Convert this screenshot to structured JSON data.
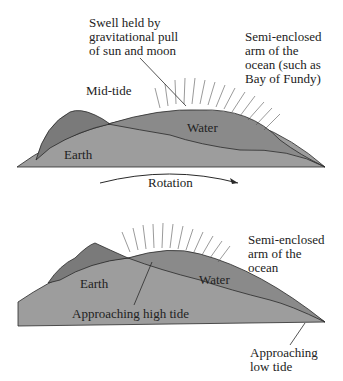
{
  "colors": {
    "earth": "#9d9d9d",
    "water": "#8a8a8a",
    "rock": "#7a7a7a",
    "line": "#2a2a2a"
  },
  "top_panel": {
    "swell_label": "Swell held by\ngravitational pull\nof sun and moon",
    "arm_label": "Semi-enclosed\narm of the\nocean (such as\nBay of Fundy)",
    "state_label": "Mid-tide",
    "water_label": "Water",
    "earth_label": "Earth",
    "rotation_label": "Rotation"
  },
  "bottom_panel": {
    "arm_label": "Semi-enclosed\narm of the\nocean",
    "earth_label": "Earth",
    "water_label": "Water",
    "high_tide_label": "Approaching high tide",
    "low_tide_label": "Approaching\nlow tide"
  }
}
